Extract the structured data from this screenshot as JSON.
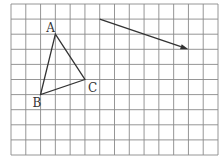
{
  "diagram": {
    "type": "grid-geometry",
    "grid": {
      "columns": 14,
      "rows": 10
    },
    "triangle": {
      "vertices": [
        {
          "label": "A",
          "col": 3,
          "row": 2
        },
        {
          "label": "B",
          "col": 2,
          "row": 6
        },
        {
          "label": "C",
          "col": 5,
          "row": 5
        }
      ]
    },
    "vector": {
      "from": {
        "col": 6,
        "row": 1
      },
      "to": {
        "col": 12,
        "row": 3
      }
    },
    "colors": {
      "grid": "#8a8a8a",
      "ink": "#333333",
      "background": "#ffffff"
    }
  }
}
